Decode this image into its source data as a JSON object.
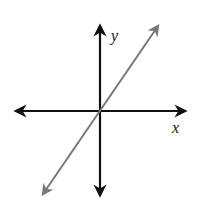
{
  "diagram": {
    "type": "coordinate-axes-with-line",
    "axes": {
      "x_label": "x",
      "y_label": "y",
      "color": "#111111"
    },
    "line": {
      "description": "straight line with positive slope through origin, arrows on both ends",
      "color": "#777777"
    }
  }
}
